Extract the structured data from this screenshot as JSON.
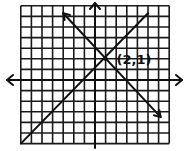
{
  "grid": {
    "x_min": -7,
    "x_max": 7,
    "y_min": -6,
    "y_max": 7
  },
  "lines": [
    {
      "name": "increasing-line",
      "from": [
        -7,
        -6
      ],
      "to": [
        5,
        6.3
      ],
      "arrow_end": false
    },
    {
      "name": "decreasing-line",
      "from": [
        1,
        2
      ],
      "from_ext": [
        -3,
        6.3
      ],
      "to": [
        6.2,
        -3.5
      ],
      "arrow_start": true,
      "arrow_end": true
    }
  ],
  "intersection": {
    "point": [
      1,
      2
    ],
    "label": "(2,1)"
  },
  "axes": {
    "x_arrows": true,
    "y_arrows": true
  }
}
